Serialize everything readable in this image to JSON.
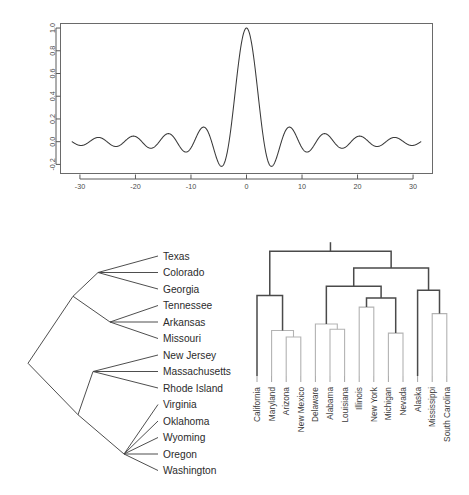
{
  "figure": {
    "title": "",
    "panels": [
      "sinc-plot",
      "phylogram",
      "dendrogram"
    ]
  },
  "chart_data": [
    {
      "id": "sinc-plot",
      "type": "line",
      "title": "",
      "xlabel": "",
      "ylabel": "",
      "xlim": [
        -33.5,
        33.5
      ],
      "ylim": [
        -0.28,
        1.04
      ],
      "xticks": [
        -30,
        -20,
        -10,
        0,
        10,
        20,
        30
      ],
      "xtick_labels": [
        "-30",
        "-20",
        "-10",
        "0",
        "10",
        "20",
        "30"
      ],
      "yticks": [
        -0.2,
        0.0,
        0.2,
        0.4,
        0.6,
        0.8,
        1.0
      ],
      "ytick_labels": [
        "-0.2",
        "0.0",
        "0.2",
        "0.4",
        "0.6",
        "0.8",
        "1.0"
      ],
      "grid": false,
      "legend": null,
      "function": "sinc(x) = sin(x)/x",
      "series": [
        {
          "name": "sinc",
          "color": "#3a3a3a",
          "notes": "Cardinal sine; peak 1.0 at x=0; zero crossings at multiples of pi; first side lobes about -0.217 near x=+/-4.49 and +0.128 near x=+/-7.73"
        }
      ]
    },
    {
      "id": "phylogram",
      "type": "tree",
      "title": "",
      "layout": "slanted-cladogram",
      "orientation": "left-to-right",
      "leaves": [
        "Texas",
        "Colorado",
        "Georgia",
        "Tennessee",
        "Arkansas",
        "Missouri",
        "New Jersey",
        "Massachusetts",
        "Rhode Island",
        "Virginia",
        "Oklahoma",
        "Wyoming",
        "Oregon",
        "Washington"
      ],
      "clusters": [
        {
          "name": "cluster-A1",
          "members": [
            "Texas",
            "Colorado",
            "Georgia"
          ]
        },
        {
          "name": "cluster-A2",
          "members": [
            "Tennessee",
            "Arkansas",
            "Missouri"
          ]
        },
        {
          "name": "cluster-A",
          "members": [
            "cluster-A1",
            "cluster-A2"
          ]
        },
        {
          "name": "cluster-B1",
          "members": [
            "New Jersey",
            "Massachusetts",
            "Rhode Island"
          ]
        },
        {
          "name": "cluster-B2",
          "members": [
            "Virginia",
            "Oklahoma",
            "Wyoming",
            "Oregon",
            "Washington"
          ]
        },
        {
          "name": "cluster-B",
          "members": [
            "cluster-B1",
            "cluster-B2"
          ]
        },
        {
          "name": "root",
          "members": [
            "cluster-A",
            "cluster-B"
          ]
        }
      ]
    },
    {
      "id": "dendrogram",
      "type": "dendrogram",
      "title": "",
      "orientation": "top-down",
      "leaves": [
        "California",
        "Maryland",
        "Arizona",
        "New Mexico",
        "Delaware",
        "Alabama",
        "Louisiana",
        "Illinois",
        "New York",
        "Michigan",
        "Nevada",
        "Alaska",
        "Mississippi",
        "South Carolina"
      ],
      "leaf_heights": [
        0,
        0,
        0,
        0,
        0,
        0,
        0,
        0,
        0,
        0,
        0,
        0,
        0,
        0
      ],
      "merges": [
        {
          "left": "Arizona",
          "right": "New Mexico",
          "height": 0.3
        },
        {
          "left": "Maryland",
          "right": "Arizona+New Mexico",
          "height": 0.35
        },
        {
          "left": "California",
          "right": "Maryland-cluster",
          "height": 0.62
        },
        {
          "left": "Alabama",
          "right": "Louisiana",
          "height": 0.36
        },
        {
          "left": "Delaware",
          "right": "Alabama+Louisiana",
          "height": 0.4
        },
        {
          "left": "Illinois",
          "right": "New York",
          "height": 0.53
        },
        {
          "left": "Michigan",
          "right": "Nevada",
          "height": 0.33
        },
        {
          "left": "Illinois-cluster",
          "right": "Michigan+Nevada",
          "height": 0.45
        },
        {
          "left": "Delaware-cluster",
          "right": "Illinois-supercluster",
          "height": 0.62
        },
        {
          "left": "Mississippi",
          "right": "South Carolina",
          "height": 0.4
        },
        {
          "left": "Alaska",
          "right": "Mississippi-cluster",
          "height": 0.62
        },
        {
          "left": "east-group",
          "right": "south-group",
          "height": 0.78
        },
        {
          "left": "west-group",
          "right": "east-south-group",
          "height": 0.92
        }
      ],
      "axis_visible": false,
      "colors": {
        "high_links": "#4a4a4a",
        "low_links": "#b3b3b3"
      }
    }
  ]
}
